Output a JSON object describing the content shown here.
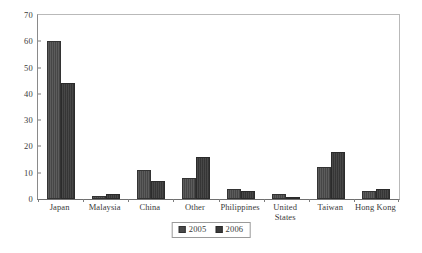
{
  "chart_data": {
    "type": "bar",
    "title": "",
    "subtitle": "",
    "xlabel": "",
    "ylabel": "",
    "ylim": [
      0,
      70
    ],
    "yticks": [
      0,
      10,
      20,
      30,
      40,
      50,
      60,
      70
    ],
    "ytick_labels": [
      "0",
      "10",
      "20",
      "30",
      "40",
      "50",
      "60",
      "70"
    ],
    "grid": false,
    "legend_position": "bottom-center",
    "categories": [
      "Japan",
      "Malaysia",
      "China",
      "Other",
      "Philippines",
      "United\nStates",
      "Taiwan",
      "Hong Kong"
    ],
    "series": [
      {
        "name": "2005",
        "color": "#4a4a4a",
        "values": [
          60,
          1,
          11,
          8,
          4,
          2,
          12,
          3
        ]
      },
      {
        "name": "2006",
        "color": "#3a3a3a",
        "values": [
          44,
          2,
          7,
          16,
          3,
          0.4,
          18,
          4
        ]
      }
    ]
  },
  "legend": {
    "entries": [
      {
        "label": "2005"
      },
      {
        "label": "2006"
      }
    ]
  },
  "colors": {
    "series_2005": "#4a4a4a",
    "series_2006": "#3a3a3a",
    "axis": "#6f6f6f",
    "frame": "#b9b9b9",
    "text": "#3a3a3a",
    "background": "#ffffff"
  }
}
